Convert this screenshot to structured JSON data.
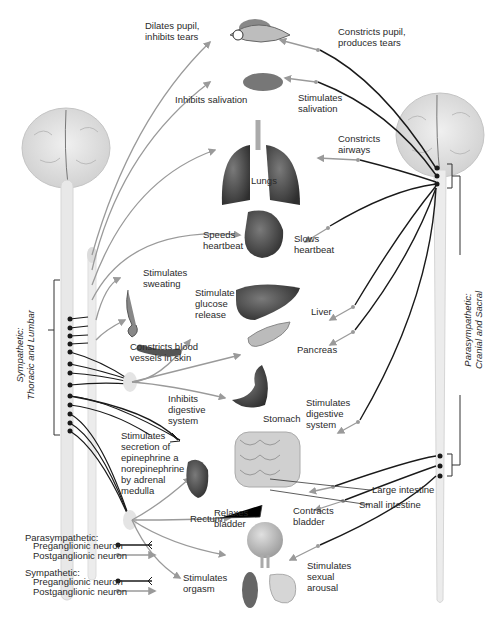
{
  "figure": {
    "colors": {
      "preganglionic": "#1a1a1a",
      "postganglionic": "#9a9a9a",
      "brain": "#dcdcdc",
      "spinal_cord": "#e8e8e8",
      "organ_dark": "#4a4a4a",
      "organ_mid": "#8a8a8a"
    }
  },
  "divisions": {
    "sympathetic": "Sympathetic:\nThoracic and Lumbar",
    "parasympathetic": "Parasympathetic:\nCranial and Sacral"
  },
  "organs": {
    "lungs": "Lungs",
    "liver": "Liver",
    "pancreas": "Pancreas",
    "stomach": "Stomach",
    "large_intestine": "Large intestine",
    "small_intestine": "Small intestine",
    "rectum": "Rectum"
  },
  "sympathetic_effects": {
    "eye": "Dilates pupil,\ninhibits tears",
    "salivary": "Inhibits salivation",
    "heart": "Speeds\nheartbeat",
    "sweat": "Stimulates\nsweating",
    "vessels": "Constricts blood\nvessels in skin",
    "glucose": "Stimulate\nglucose\nrelease",
    "digestive": "Inhibits\ndigestive\nsystem",
    "adrenal": "Stimulates\nsecretion of\nepinephrine a\nnorepinephrine\nby adrenal\nmedulla",
    "bladder": "Relaxes\nbladder",
    "orgasm": "Stimulates\norgasm"
  },
  "parasympathetic_effects": {
    "eye": "Constricts pupil,\nproduces tears",
    "salivary": "Stimulates\nsalivation",
    "airways": "Constricts\nairways",
    "heart": "Slows\nheartbeat",
    "digestive": "Stimulates\ndigestive\nsystem",
    "bladder": "Contracts\nbladder",
    "arousal": "Stimulates\nsexual\narousal"
  },
  "legend": {
    "parasympathetic": {
      "title": "Parasympathetic:",
      "items": [
        {
          "label": "Preganglionic neuron",
          "type": "preganglionic"
        },
        {
          "label": "Postganglionic neuron",
          "type": "postganglionic"
        }
      ]
    },
    "sympathetic": {
      "title": "Sympathetic:",
      "items": [
        {
          "label": "Preganglionic neuron",
          "type": "preganglionic"
        },
        {
          "label": "Postganglionic neuron",
          "type": "postganglionic"
        }
      ]
    }
  }
}
